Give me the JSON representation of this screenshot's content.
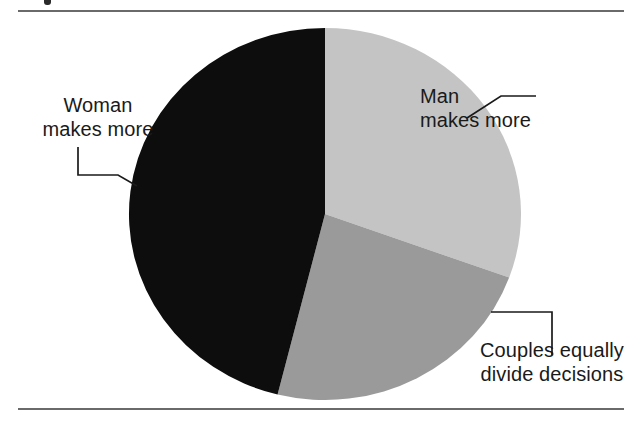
{
  "figure": {
    "background_color": "#ffffff",
    "rule_color": "#6a6a6a",
    "width": 642,
    "height": 426
  },
  "chart_data": {
    "type": "pie",
    "title": "",
    "subtitle": "",
    "xlabel": "",
    "ylabel": "",
    "grid": false,
    "legend_position": "callout-labels",
    "center": {
      "x": 325,
      "y": 214
    },
    "radius_x": 196,
    "radius_y": 186,
    "start_angle_deg": 0,
    "direction": "clockwise",
    "categories": [
      "Man makes more",
      "Couples equally divide decisions",
      "Woman makes more"
    ],
    "values": [
      31,
      23,
      46
    ],
    "units": "percent",
    "slices": [
      {
        "label": "Man makes more",
        "label_line_1": "Man",
        "label_line_2": "makes more",
        "value": 31,
        "color": "#c4c4c4",
        "start_deg": 0,
        "end_deg": 110
      },
      {
        "label": "Couples equally divide decisions",
        "label_line_1": "Couples equally",
        "label_line_2": "divide decisions",
        "value": 23,
        "color": "#9a9a9a",
        "start_deg": 110,
        "end_deg": 194
      },
      {
        "label": "Woman makes more",
        "label_line_1": "Woman",
        "label_line_2": "makes more",
        "value": 46,
        "color": "#0d0d0d",
        "start_deg": 194,
        "end_deg": 360
      }
    ],
    "annotations": [
      {
        "name": "man-callout",
        "text": "Man makes more",
        "leader": "diagonal-then-horizontal"
      },
      {
        "name": "woman-callout",
        "text": "Woman makes more",
        "leader": "vertical-then-horizontal-then-diagonal"
      },
      {
        "name": "couples-callout",
        "text": "Couples equally divide decisions",
        "leader": "horizontal-then-vertical"
      }
    ]
  },
  "labels": {
    "man": {
      "line1": "Man",
      "line2": "makes more"
    },
    "woman": {
      "line1": "Woman",
      "line2": "makes more"
    },
    "couples": {
      "line1": "Couples equally",
      "line2": "divide decisions"
    }
  }
}
